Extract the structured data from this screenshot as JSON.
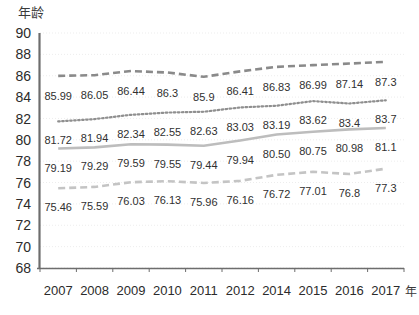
{
  "chart_data": {
    "type": "line",
    "title": "",
    "subtitle": "",
    "ylabel": "年龄",
    "xlabel": "年份",
    "xlabel_visible": "年",
    "grid": true,
    "legend": "none",
    "ylim": [
      68,
      90
    ],
    "ytick_step": 2,
    "yticks": [
      "90",
      "88",
      "86",
      "84",
      "82",
      "80",
      "78",
      "76",
      "74",
      "72",
      "70",
      "68"
    ],
    "categories": [
      "2007",
      "2008",
      "2009",
      "2010",
      "2011",
      "2012",
      "2014",
      "2015",
      "2016",
      "2017"
    ],
    "series": [
      {
        "name": "series-1",
        "style": "dashed",
        "color": "#8a8a8a",
        "values": [
          85.99,
          86.05,
          86.44,
          86.3,
          85.9,
          86.41,
          86.83,
          86.99,
          87.14,
          87.3
        ],
        "labels": [
          "85.99",
          "86.05",
          "86.44",
          "86.3",
          "85.9",
          "86.41",
          "86.83",
          "86.99",
          "87.14",
          "87.3"
        ]
      },
      {
        "name": "series-2",
        "style": "dotted",
        "color": "#8f8f8f",
        "values": [
          81.72,
          81.94,
          82.34,
          82.55,
          82.63,
          83.03,
          83.19,
          83.62,
          83.4,
          83.7
        ],
        "labels": [
          "81.72",
          "81.94",
          "82.34",
          "82.55",
          "82.63",
          "83.03",
          "83.19",
          "83.62",
          "83.4",
          "83.7"
        ]
      },
      {
        "name": "series-3",
        "style": "solid",
        "color": "#bdbdbd",
        "values": [
          79.19,
          79.29,
          79.59,
          79.55,
          79.44,
          79.94,
          80.5,
          80.75,
          80.98,
          81.1
        ],
        "labels": [
          "79.19",
          "79.29",
          "79.59",
          "79.55",
          "79.44",
          "79.94",
          "80.50",
          "80.75",
          "80.98",
          "81.1"
        ]
      },
      {
        "name": "series-4",
        "style": "dashed",
        "color": "#c4c4c4",
        "values": [
          75.46,
          75.59,
          76.03,
          76.13,
          75.96,
          76.16,
          76.72,
          77.01,
          76.8,
          77.3
        ],
        "labels": [
          "75.46",
          "75.59",
          "76.03",
          "76.13",
          "75.96",
          "76.16",
          "76.72",
          "77.01",
          "76.8",
          "77.3"
        ]
      }
    ],
    "axis_color": "#6d6d6d",
    "grid_color": "#ededed"
  }
}
